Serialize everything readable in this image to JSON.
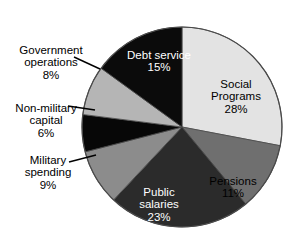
{
  "chart_data": {
    "type": "pie",
    "title": "",
    "legend_position": "none",
    "grid": false,
    "categories": [
      "Social Programs",
      "Pensions",
      "Public salaries",
      "Military spending",
      "Non-military capital",
      "Government operations",
      "Debt service"
    ],
    "values": [
      28,
      11,
      23,
      9,
      6,
      8,
      15
    ],
    "value_suffix": "%",
    "start_angle_deg": 0,
    "direction": "clockwise",
    "slices": [
      {
        "label": "Social\nPrograms",
        "label_flat": "Social Programs",
        "value": 28,
        "value_text": "28%",
        "color": "#e3e3e3",
        "text_color": "#000000",
        "label_placement": "inside"
      },
      {
        "label": "Pensions",
        "label_flat": "Pensions",
        "value": 11,
        "value_text": "11%",
        "color": "#6f6f6f",
        "text_color": "#000000",
        "label_placement": "inside"
      },
      {
        "label": "Public\nsalaries",
        "label_flat": "Public salaries",
        "value": 23,
        "value_text": "23%",
        "color": "#2b2b2b",
        "text_color": "#ffffff",
        "label_placement": "inside"
      },
      {
        "label": "Military\nspending",
        "label_flat": "Military spending",
        "value": 9,
        "value_text": "9%",
        "color": "#8c8c8c",
        "text_color": "#000000",
        "label_placement": "outside"
      },
      {
        "label": "Non-military\ncapital",
        "label_flat": "Non-military capital",
        "value": 6,
        "value_text": "6%",
        "color": "#070707",
        "text_color": "#000000",
        "label_placement": "outside"
      },
      {
        "label": "Government\noperations",
        "label_flat": "Government operations",
        "value": 8,
        "value_text": "8%",
        "color": "#b5b5b5",
        "text_color": "#000000",
        "label_placement": "outside"
      },
      {
        "label": "Debt service",
        "label_flat": "Debt service",
        "value": 15,
        "value_text": "15%",
        "color": "#0b0b0b",
        "text_color": "#ffffff",
        "label_placement": "inside"
      }
    ],
    "geometry": {
      "center_x": 182,
      "center_y": 127,
      "radius": 100,
      "outline_color": "#4a4a4a"
    }
  },
  "background_color": "#ffffff"
}
